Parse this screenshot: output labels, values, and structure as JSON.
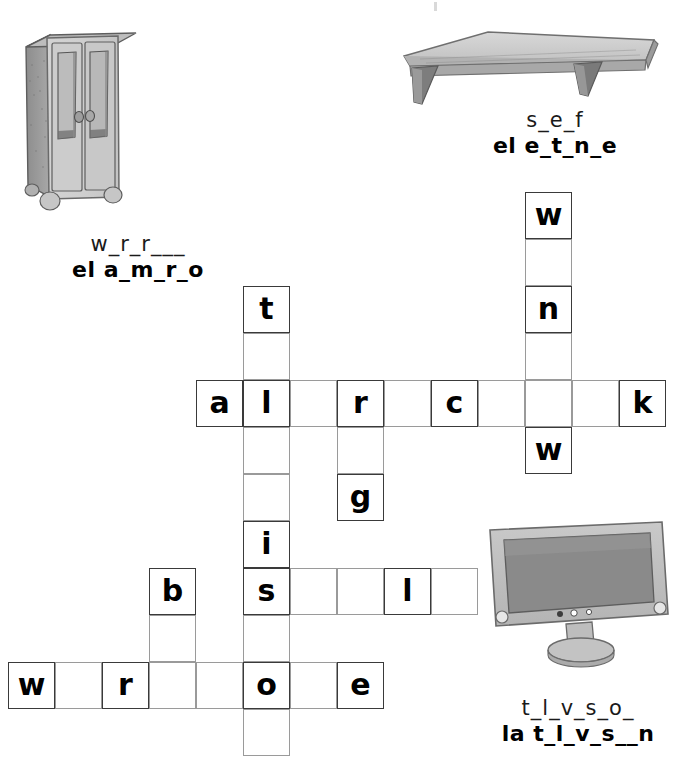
{
  "worksheet": {
    "title": "Bedroom furniture picture crossword",
    "cell_size": 47,
    "ink_color": "#000000",
    "grid_line_color": "#9a9a9a"
  },
  "pictures": [
    {
      "name": "wardrobe-illustration",
      "alt": "pencil drawing of a two-door wardrobe",
      "clue_english": "w_r_r___",
      "clue_spanish": "el a_m_r_o"
    },
    {
      "name": "shelf-illustration",
      "alt": "pencil drawing of a wall shelf with brackets",
      "clue_english": "s_e_f",
      "clue_spanish": "el e_t_n_e"
    },
    {
      "name": "television-illustration",
      "alt": "pencil drawing of a flat screen television on a stand",
      "clue_english": "t_l_v_s_o_",
      "clue_spanish": "la t_l_v_s__n"
    }
  ],
  "clues": {
    "wardrobe": {
      "english": "w_r_r___",
      "spanish": "el a_m_r_o"
    },
    "shelf": {
      "english": "s_e_f",
      "spanish": "el e_t_n_e"
    },
    "television": {
      "english": "t_l_v_s_o_",
      "spanish": "la t_l_v_s__n"
    }
  },
  "crossword": {
    "entries": [
      {
        "id": "window",
        "direction": "down",
        "length": 6,
        "col": 7,
        "row": -4,
        "letters": [
          "w",
          "",
          "n",
          "",
          "",
          "w"
        ]
      },
      {
        "id": "television",
        "direction": "down",
        "length": 10,
        "col": 1,
        "row": -2,
        "letters": [
          "t",
          "",
          "l",
          "",
          "",
          "i",
          "s",
          "",
          "o",
          ""
        ]
      },
      {
        "id": "alarmclock",
        "direction": "across",
        "length": 10,
        "col": 0,
        "row": 0,
        "letters": [
          "a",
          "l",
          "",
          "r",
          "",
          "c",
          "",
          "",
          "",
          "k"
        ]
      },
      {
        "id": "rug",
        "direction": "down",
        "length": 3,
        "col": 3,
        "row": 0,
        "letters": [
          "r",
          "",
          "g"
        ]
      },
      {
        "id": "shelf",
        "direction": "across",
        "length": 5,
        "col": 1,
        "row": 4,
        "letters": [
          "s",
          "",
          "",
          "l",
          ""
        ]
      },
      {
        "id": "bed",
        "direction": "down",
        "length": 3,
        "col": -1,
        "row": 4,
        "letters": [
          "b",
          "",
          ""
        ]
      },
      {
        "id": "wardrobe",
        "direction": "across",
        "length": 8,
        "col": -4,
        "row": 6,
        "letters": [
          "w",
          "",
          "r",
          "",
          "",
          "o",
          "",
          "e"
        ]
      }
    ],
    "given_letters": [
      {
        "letter": "w",
        "col": 7,
        "row": -4
      },
      {
        "letter": "n",
        "col": 7,
        "row": -2
      },
      {
        "letter": "t",
        "col": 1,
        "row": -2
      },
      {
        "letter": "a",
        "col": 0,
        "row": 0
      },
      {
        "letter": "l",
        "col": 1,
        "row": 0
      },
      {
        "letter": "r",
        "col": 3,
        "row": 0
      },
      {
        "letter": "c",
        "col": 5,
        "row": 0
      },
      {
        "letter": "k",
        "col": 9,
        "row": 0
      },
      {
        "letter": "w",
        "col": 7,
        "row": 1
      },
      {
        "letter": "g",
        "col": 3,
        "row": 2
      },
      {
        "letter": "i",
        "col": 1,
        "row": 3
      },
      {
        "letter": "b",
        "col": -1,
        "row": 4
      },
      {
        "letter": "s",
        "col": 1,
        "row": 4
      },
      {
        "letter": "l",
        "col": 4,
        "row": 4
      },
      {
        "letter": "w",
        "col": -4,
        "row": 6
      },
      {
        "letter": "r",
        "col": -2,
        "row": 6
      },
      {
        "letter": "o",
        "col": 1,
        "row": 6
      },
      {
        "letter": "e",
        "col": 3,
        "row": 6
      }
    ]
  }
}
